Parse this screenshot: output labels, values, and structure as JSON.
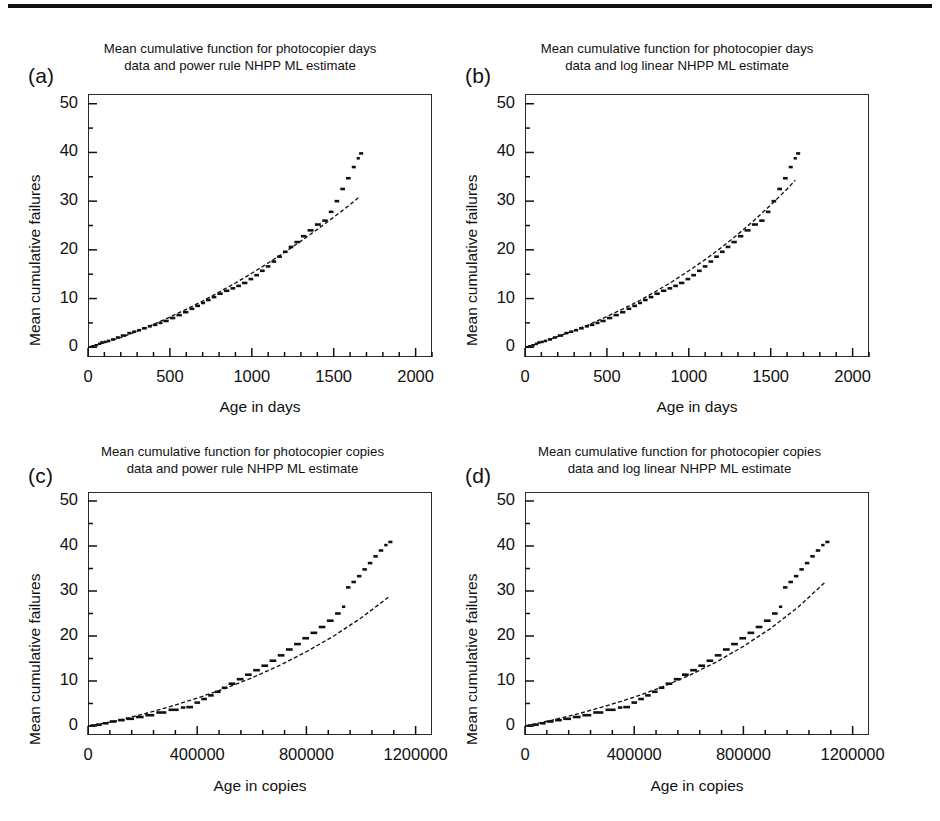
{
  "figure": {
    "background": "#ffffff",
    "ink_color": "#111111",
    "top_rule": true
  },
  "chart_data": [
    {
      "panel": "a",
      "letter": "(a)",
      "type": "line",
      "title": "Mean cumulative function for photocopier days data  and power rule NHPP ML estimate",
      "title_line1": "Mean cumulative function for photocopier days",
      "title_line2": "data  and power rule NHPP ML estimate",
      "xlabel": "Age in days",
      "ylabel": "Mean cumulative failures",
      "xlim": [
        0,
        2100
      ],
      "ylim": [
        -2,
        52
      ],
      "xticks": [
        0,
        500,
        1000,
        1500,
        2000
      ],
      "xticklabels": [
        "0",
        "500",
        "1000",
        "1500",
        "2000"
      ],
      "yticks": [
        0,
        10,
        20,
        30,
        40,
        50
      ],
      "yticklabels": [
        "0",
        "10",
        "20",
        "30",
        "40",
        "50"
      ],
      "x_minor_per_major": 5,
      "y_minor_per_major": 2,
      "grid": false,
      "legend": null,
      "series": [
        {
          "name": "MCF data (step)",
          "style": "step-dashes",
          "x": [
            20,
            40,
            60,
            75,
            95,
            115,
            140,
            170,
            200,
            240,
            270,
            300,
            330,
            365,
            395,
            430,
            460,
            500,
            540,
            580,
            620,
            655,
            690,
            720,
            755,
            790,
            830,
            870,
            905,
            940,
            980,
            1015,
            1050,
            1085,
            1120,
            1155,
            1190,
            1225,
            1260,
            1300,
            1340,
            1385,
            1430,
            1470,
            1505,
            1540,
            1575,
            1610,
            1640,
            1655
          ],
          "y": [
            0.2,
            0.4,
            0.7,
            1.0,
            1.1,
            1.3,
            1.6,
            2.0,
            2.4,
            2.9,
            3.2,
            3.5,
            3.9,
            4.3,
            4.6,
            5.0,
            5.4,
            6.0,
            6.6,
            7.2,
            7.9,
            8.5,
            9.1,
            9.7,
            10.3,
            11.0,
            11.6,
            12.1,
            12.6,
            13.2,
            14.0,
            14.8,
            15.7,
            16.6,
            17.6,
            18.6,
            19.6,
            20.6,
            21.6,
            22.8,
            24.0,
            25.2,
            26.0,
            27.8,
            30.0,
            32.5,
            34.7,
            37.0,
            38.8,
            39.8
          ]
        },
        {
          "name": "Power rule NHPP ML estimate",
          "style": "dashed-curve",
          "model": "power",
          "x": [
            0,
            100,
            200,
            300,
            400,
            500,
            600,
            700,
            800,
            900,
            1000,
            1100,
            1200,
            1300,
            1400,
            1500,
            1600,
            1650
          ],
          "y": [
            0.0,
            0.9,
            2.0,
            3.3,
            4.7,
            6.2,
            7.8,
            9.5,
            11.3,
            13.2,
            15.2,
            17.3,
            19.5,
            21.8,
            24.2,
            26.7,
            29.3,
            30.7
          ]
        }
      ]
    },
    {
      "panel": "b",
      "letter": "(b)",
      "type": "line",
      "title": "Mean cumulative function for photocopier days data  and log linear NHPP ML estimate",
      "title_line1": "Mean cumulative function for photocopier days",
      "title_line2": "data  and log linear NHPP ML estimate",
      "xlabel": "Age in days",
      "ylabel": "Mean cumulative failures",
      "xlim": [
        0,
        2100
      ],
      "ylim": [
        -2,
        52
      ],
      "xticks": [
        0,
        500,
        1000,
        1500,
        2000
      ],
      "xticklabels": [
        "0",
        "500",
        "1000",
        "1500",
        "2000"
      ],
      "yticks": [
        0,
        10,
        20,
        30,
        40,
        50
      ],
      "yticklabels": [
        "0",
        "10",
        "20",
        "30",
        "40",
        "50"
      ],
      "x_minor_per_major": 5,
      "y_minor_per_major": 2,
      "grid": false,
      "legend": null,
      "series": [
        {
          "name": "MCF data (step)",
          "style": "step-dashes",
          "x": [
            20,
            40,
            60,
            75,
            95,
            115,
            140,
            170,
            200,
            240,
            270,
            300,
            330,
            365,
            395,
            430,
            460,
            500,
            540,
            580,
            620,
            655,
            690,
            720,
            755,
            790,
            830,
            870,
            905,
            940,
            980,
            1015,
            1050,
            1085,
            1120,
            1155,
            1190,
            1225,
            1260,
            1300,
            1340,
            1385,
            1430,
            1470,
            1505,
            1540,
            1575,
            1610,
            1640,
            1655
          ],
          "y": [
            0.2,
            0.4,
            0.7,
            1.0,
            1.1,
            1.3,
            1.6,
            2.0,
            2.4,
            2.9,
            3.2,
            3.5,
            3.9,
            4.3,
            4.6,
            5.0,
            5.4,
            6.0,
            6.6,
            7.2,
            7.9,
            8.5,
            9.1,
            9.7,
            10.3,
            11.0,
            11.6,
            12.1,
            12.6,
            13.2,
            14.0,
            14.8,
            15.7,
            16.6,
            17.6,
            18.6,
            19.6,
            20.6,
            21.6,
            22.8,
            24.0,
            25.2,
            26.0,
            27.8,
            30.0,
            32.5,
            34.7,
            37.0,
            38.8,
            39.8
          ]
        },
        {
          "name": "Log linear NHPP ML estimate",
          "style": "dashed-curve",
          "model": "loglinear",
          "x": [
            0,
            100,
            200,
            300,
            400,
            500,
            600,
            700,
            800,
            900,
            1000,
            1100,
            1200,
            1300,
            1400,
            1500,
            1600,
            1650
          ],
          "y": [
            0.0,
            1.0,
            2.2,
            3.4,
            4.8,
            6.3,
            7.9,
            9.6,
            11.5,
            13.5,
            15.7,
            18.0,
            20.5,
            23.2,
            26.1,
            29.2,
            32.5,
            34.3
          ]
        }
      ]
    },
    {
      "panel": "c",
      "letter": "(c)",
      "type": "line",
      "title": "Mean cumulative function for photocopier copies data  and power rule NHPP ML estimate",
      "title_line1": "Mean cumulative function for photocopier copies",
      "title_line2": "data  and power rule NHPP ML estimate",
      "xlabel": "Age in copies",
      "ylabel": "Mean cumulative failures",
      "xlim": [
        0,
        1260000
      ],
      "ylim": [
        -2,
        52
      ],
      "xticks": [
        0,
        400000,
        800000,
        1200000
      ],
      "xticklabels": [
        "0",
        "400000",
        "800000",
        "1200000"
      ],
      "yticks": [
        0,
        10,
        20,
        30,
        40,
        50
      ],
      "yticklabels": [
        "0",
        "10",
        "20",
        "30",
        "40",
        "50"
      ],
      "x_minor_per_major": 5,
      "y_minor_per_major": 2,
      "grid": false,
      "legend": null,
      "series": [
        {
          "name": "MCF data (step)",
          "style": "step-dashes",
          "x": [
            10000,
            30000,
            55000,
            80000,
            110000,
            140000,
            175000,
            210000,
            250000,
            295000,
            340000,
            360000,
            390000,
            415000,
            440000,
            465000,
            490000,
            515000,
            545000,
            575000,
            605000,
            635000,
            665000,
            695000,
            725000,
            755000,
            785000,
            815000,
            845000,
            875000,
            905000,
            930000,
            945000,
            965000,
            985000,
            1005000,
            1025000,
            1045000,
            1065000,
            1085000,
            1100000
          ],
          "y": [
            0.1,
            0.3,
            0.6,
            1.0,
            1.3,
            1.6,
            2.0,
            2.4,
            3.0,
            3.6,
            4.1,
            4.2,
            5.2,
            6.0,
            6.8,
            7.6,
            8.5,
            9.4,
            10.4,
            11.4,
            12.4,
            13.4,
            14.5,
            15.7,
            17.0,
            18.2,
            19.5,
            20.7,
            22.0,
            23.4,
            25.0,
            26.5,
            30.8,
            32.0,
            33.3,
            34.8,
            36.2,
            37.7,
            39.0,
            40.2,
            40.9
          ]
        },
        {
          "name": "Power rule NHPP ML estimate",
          "style": "dashed-curve",
          "model": "power",
          "x": [
            0,
            100000,
            200000,
            300000,
            400000,
            500000,
            600000,
            700000,
            800000,
            900000,
            1000000,
            1100000
          ],
          "y": [
            0.0,
            1.1,
            2.6,
            4.3,
            6.2,
            8.3,
            10.7,
            13.4,
            16.5,
            20.0,
            24.0,
            28.6
          ]
        }
      ]
    },
    {
      "panel": "d",
      "letter": "(d)",
      "type": "line",
      "title": "Mean cumulative function for photocopier copies data  and log linear NHPP ML estimate",
      "title_line1": "Mean cumulative function for photocopier copies",
      "title_line2": "data  and log linear NHPP ML estimate",
      "xlabel": "Age in copies",
      "ylabel": "Mean cumulative failures",
      "xlim": [
        0,
        1260000
      ],
      "ylim": [
        -2,
        52
      ],
      "xticks": [
        0,
        400000,
        800000,
        1200000
      ],
      "xticklabels": [
        "0",
        "400000",
        "800000",
        "1200000"
      ],
      "yticks": [
        0,
        10,
        20,
        30,
        40,
        50
      ],
      "yticklabels": [
        "0",
        "10",
        "20",
        "30",
        "40",
        "50"
      ],
      "x_minor_per_major": 5,
      "y_minor_per_major": 2,
      "grid": false,
      "legend": null,
      "series": [
        {
          "name": "MCF data (step)",
          "style": "step-dashes",
          "x": [
            10000,
            30000,
            55000,
            80000,
            110000,
            140000,
            175000,
            210000,
            250000,
            295000,
            340000,
            360000,
            390000,
            415000,
            440000,
            465000,
            490000,
            515000,
            545000,
            575000,
            605000,
            635000,
            665000,
            695000,
            725000,
            755000,
            785000,
            815000,
            845000,
            875000,
            905000,
            930000,
            945000,
            965000,
            985000,
            1005000,
            1025000,
            1045000,
            1065000,
            1085000,
            1100000
          ],
          "y": [
            0.1,
            0.3,
            0.6,
            1.0,
            1.3,
            1.6,
            2.0,
            2.4,
            3.0,
            3.6,
            4.1,
            4.2,
            5.2,
            6.0,
            6.8,
            7.6,
            8.5,
            9.4,
            10.4,
            11.4,
            12.4,
            13.4,
            14.5,
            15.7,
            17.0,
            18.2,
            19.5,
            20.7,
            22.0,
            23.4,
            25.0,
            26.5,
            30.8,
            32.0,
            33.3,
            34.8,
            36.2,
            37.7,
            39.0,
            40.2,
            40.9
          ]
        },
        {
          "name": "Log linear NHPP ML estimate",
          "style": "dashed-curve",
          "model": "loglinear",
          "x": [
            0,
            100000,
            200000,
            300000,
            400000,
            500000,
            600000,
            700000,
            800000,
            900000,
            1000000,
            1100000
          ],
          "y": [
            0.0,
            1.3,
            2.8,
            4.5,
            6.4,
            8.6,
            11.2,
            14.2,
            17.7,
            21.7,
            26.4,
            32.0
          ]
        }
      ]
    }
  ]
}
